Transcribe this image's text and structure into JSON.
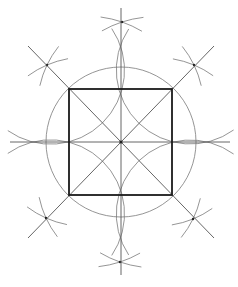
{
  "diagram": {
    "center": [
      121,
      142
    ],
    "colors": {
      "background": "#ffffff",
      "square": "#1a1a1a",
      "construction": "#7a7a7a",
      "axes": "#555555"
    },
    "square": {
      "x1": 69,
      "y1": 89,
      "x2": 172,
      "y2": 195
    },
    "axes": {
      "horizontal": {
        "x1": 10,
        "y1": 142,
        "x2": 230,
        "y2": 142
      },
      "vertical": {
        "x1": 121,
        "y1": 8,
        "x2": 121,
        "y2": 275
      }
    },
    "diagonals": [
      {
        "x1": 28,
        "y1": 46,
        "x2": 214,
        "y2": 238
      },
      {
        "x1": 214,
        "y1": 46,
        "x2": 28,
        "y2": 238
      }
    ],
    "central_circle": {
      "cx": 121,
      "cy": 142,
      "r": 75
    },
    "corner_arcs": [
      {
        "name": "arc-top-left",
        "cx": 69,
        "cy": 89,
        "r": 74
      },
      {
        "name": "arc-top-right",
        "cx": 172,
        "cy": 89,
        "r": 74
      },
      {
        "name": "arc-bottom-left",
        "cx": 69,
        "cy": 195,
        "r": 74
      },
      {
        "name": "arc-bottom-right",
        "cx": 172,
        "cy": 195,
        "r": 74
      }
    ],
    "construction_points": [
      {
        "name": "top",
        "x": 122,
        "y": 22
      },
      {
        "name": "bottom",
        "x": 120,
        "y": 262
      },
      {
        "name": "top-left",
        "x": 47,
        "y": 65
      },
      {
        "name": "top-right",
        "x": 194,
        "y": 65
      },
      {
        "name": "bottom-left",
        "x": 46,
        "y": 218
      },
      {
        "name": "bottom-right",
        "x": 193,
        "y": 219
      }
    ]
  }
}
